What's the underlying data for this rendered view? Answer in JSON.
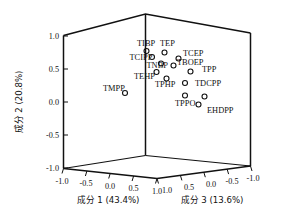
{
  "chart_data": {
    "type": "scatter",
    "title": "",
    "subtitle": "",
    "projection": "3d",
    "xlabel": "成分 1 (43.4%)",
    "ylabel": "成分 2 (20.8%)",
    "zlabel": "成分 3 (13.6%)",
    "xlim": [
      -1.0,
      1.0
    ],
    "ylim": [
      -1.0,
      1.0
    ],
    "zlim": [
      -1.0,
      1.0
    ],
    "grid": false,
    "legend": "none",
    "xticks": [
      "-1.0",
      "-0.5",
      "0.0",
      "0.5",
      "1.0"
    ],
    "yticks": [
      "1.0",
      "0.5",
      "0.0",
      "-0.5",
      "-1.0"
    ],
    "zticks": [
      "1.0",
      "0.5",
      "0.0",
      "-0.5",
      "-1.0"
    ],
    "z_axis_direction": "reversed",
    "marker_style": "open-circle",
    "marker_color": "#111111",
    "point_count": 14,
    "points": [
      {
        "label": "TIBP",
        "x": 0.3,
        "y": 0.82,
        "z": 0.1,
        "px": 146.5,
        "py": 51.0,
        "lx": 137.0,
        "ly": 45.5,
        "anchor": "start"
      },
      {
        "label": "TEP",
        "x": 0.55,
        "y": 0.8,
        "z": 0.2,
        "px": 164.5,
        "py": 52.5,
        "lx": 160.0,
        "ly": 45.5,
        "anchor": "start"
      },
      {
        "label": "TCIPP",
        "x": 0.22,
        "y": 0.72,
        "z": 0.05,
        "px": 152.0,
        "py": 57.0,
        "lx": 129.5,
        "ly": 60.0,
        "anchor": "start"
      },
      {
        "label": "TCEP",
        "x": 0.62,
        "y": 0.72,
        "z": 0.25,
        "px": 178.5,
        "py": 58.5,
        "lx": 183.0,
        "ly": 56.0,
        "anchor": "start"
      },
      {
        "label": "TNBP",
        "x": 0.35,
        "y": 0.6,
        "z": 0.12,
        "px": 161.0,
        "py": 63.5,
        "lx": 146.5,
        "ly": 68.0,
        "anchor": "start"
      },
      {
        "label": "TBOEP",
        "x": 0.6,
        "y": 0.58,
        "z": 0.22,
        "px": 173.5,
        "py": 65.5,
        "lx": 177.0,
        "ly": 64.5,
        "anchor": "start"
      },
      {
        "label": "TPP",
        "x": 0.7,
        "y": 0.48,
        "z": 0.3,
        "px": 190.5,
        "py": 71.5,
        "lx": 202.0,
        "ly": 72.0,
        "anchor": "start"
      },
      {
        "label": "TEHP",
        "x": 0.18,
        "y": 0.42,
        "z": 0.02,
        "px": 156.5,
        "py": 72.0,
        "lx": 134.0,
        "ly": 79.0,
        "anchor": "start"
      },
      {
        "label": "TPHP",
        "x": 0.4,
        "y": 0.35,
        "z": 0.15,
        "px": 166.5,
        "py": 78.5,
        "lx": 155.0,
        "ly": 87.0,
        "anchor": "start"
      },
      {
        "label": "TDCPP",
        "x": 0.66,
        "y": 0.38,
        "z": 0.28,
        "px": 185.0,
        "py": 83.0,
        "lx": 195.0,
        "ly": 85.5,
        "anchor": "start"
      },
      {
        "label": "TMPP",
        "x": -0.05,
        "y": 0.08,
        "z": -0.05,
        "px": 125.0,
        "py": 93.0,
        "lx": 103.0,
        "ly": 90.5,
        "anchor": "start"
      },
      {
        "label": "TPPO",
        "x": 0.52,
        "y": 0.14,
        "z": 0.24,
        "px": 185.0,
        "py": 95.5,
        "lx": 175.0,
        "ly": 105.5,
        "anchor": "start"
      },
      {
        "label": "EHDPP",
        "x": 0.7,
        "y": 0.05,
        "z": 0.34,
        "px": 204.5,
        "py": 96.5,
        "lx": 207.0,
        "ly": 113.0,
        "anchor": "start"
      },
      {
        "label": "EHDPP2",
        "x": 0.68,
        "y": -0.05,
        "z": 0.32,
        "px": 198.5,
        "py": 104.5,
        "lx": 0,
        "ly": 0,
        "anchor": "none"
      }
    ]
  },
  "geometry": {
    "note": "3D box corner pixel coordinates in original 284x224 image space",
    "back_top_left": {
      "x": 63.5,
      "y": 35.5
    },
    "back_top_mid": {
      "x": 145.5,
      "y": 14.0
    },
    "back_top_right": {
      "x": 250.5,
      "y": 33.0
    },
    "back_bottom_mid": {
      "x": 145.5,
      "y": 155.5
    },
    "front_bottom_left": {
      "x": 63.5,
      "y": 168.5
    },
    "front_bottom_mid": {
      "x": 157.0,
      "y": 178.5
    },
    "front_bottom_right": {
      "x": 250.5,
      "y": 166.0
    },
    "left_wall_bottom": {
      "x": 63.5,
      "y": 168.5
    },
    "right_wall_bottom": {
      "x": 250.5,
      "y": 166.0
    }
  }
}
